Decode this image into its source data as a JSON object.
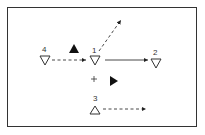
{
  "diagram": {
    "nodes": [
      {
        "id": "4",
        "label": "4",
        "shape": "triangle-down",
        "x": 45,
        "y": 60
      },
      {
        "id": "1",
        "label": "1",
        "shape": "triangle-down",
        "x": 95,
        "y": 60
      },
      {
        "id": "2",
        "label": "2",
        "shape": "triangle-down",
        "x": 156,
        "y": 63
      },
      {
        "id": "3",
        "label": "3",
        "shape": "triangle-up",
        "x": 95,
        "y": 111
      }
    ],
    "edges": [
      {
        "from": "4",
        "to": "1",
        "style": "dashed"
      },
      {
        "from": "1",
        "to": "2",
        "style": "solid"
      },
      {
        "from": "1",
        "to": "upper-right",
        "style": "dashed"
      },
      {
        "from": "3",
        "to": "right",
        "style": "dashed"
      }
    ],
    "markers": [
      {
        "type": "filled-triangle-up",
        "x": 74,
        "y": 49
      },
      {
        "type": "filled-triangle-right",
        "x": 114,
        "y": 81
      },
      {
        "type": "plus",
        "x": 94,
        "y": 79
      }
    ],
    "colors": {
      "stroke": "#333333",
      "fill": "#111111"
    }
  }
}
